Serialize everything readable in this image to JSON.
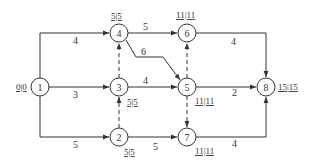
{
  "diagram": {
    "type": "activity-on-arrow network",
    "colors": {
      "stroke": "#333333",
      "background": "#ffffff"
    },
    "nodes": [
      {
        "id": "1",
        "label": "1",
        "time_label": "0|0"
      },
      {
        "id": "2",
        "label": "2",
        "time_label": "5|5"
      },
      {
        "id": "3",
        "label": "3",
        "time_label": "5|5"
      },
      {
        "id": "4",
        "label": "4",
        "time_label": "5|5"
      },
      {
        "id": "5",
        "label": "5",
        "time_label": "11|11"
      },
      {
        "id": "6",
        "label": "6",
        "time_label": "11|11"
      },
      {
        "id": "7",
        "label": "7",
        "time_label": "11|11"
      },
      {
        "id": "8",
        "label": "8",
        "time_label": "15|15"
      }
    ],
    "edges": [
      {
        "from": "1",
        "to": "4",
        "duration": "4",
        "style": "solid"
      },
      {
        "from": "1",
        "to": "3",
        "duration": "3",
        "style": "solid"
      },
      {
        "from": "1",
        "to": "2",
        "duration": "5",
        "style": "solid"
      },
      {
        "from": "4",
        "to": "6",
        "duration": "5",
        "style": "solid"
      },
      {
        "from": "4",
        "to": "5",
        "duration": "6",
        "style": "solid"
      },
      {
        "from": "3",
        "to": "5",
        "duration": "4",
        "style": "solid"
      },
      {
        "from": "2",
        "to": "7",
        "duration": "5",
        "style": "solid"
      },
      {
        "from": "6",
        "to": "8",
        "duration": "4",
        "style": "solid"
      },
      {
        "from": "5",
        "to": "8",
        "duration": "2",
        "style": "solid"
      },
      {
        "from": "7",
        "to": "8",
        "duration": "4",
        "style": "solid"
      },
      {
        "from": "3",
        "to": "4",
        "duration": "",
        "style": "dashed"
      },
      {
        "from": "2",
        "to": "3",
        "duration": "",
        "style": "dashed"
      },
      {
        "from": "5",
        "to": "6",
        "duration": "",
        "style": "dashed"
      },
      {
        "from": "5",
        "to": "7",
        "duration": "",
        "style": "dashed"
      }
    ]
  }
}
